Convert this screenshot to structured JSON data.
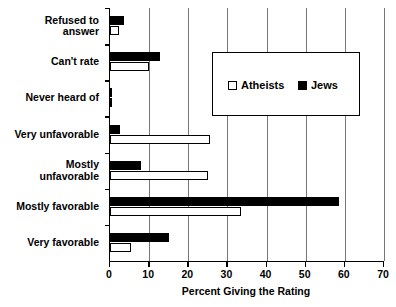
{
  "chart_data": {
    "type": "bar",
    "orientation": "horizontal",
    "title": "",
    "xlabel": "Percent Giving the Rating",
    "ylabel": "",
    "xlim": [
      0,
      70
    ],
    "xticks": [
      0,
      10,
      20,
      30,
      40,
      50,
      60,
      70
    ],
    "grid": true,
    "legend_position": "upper-right-inside",
    "categories": [
      "Refused to\nanswer",
      "Can't rate",
      "Never heard of",
      "Very unfavorable",
      "Mostly\nunfavorable",
      "Mostly favorable",
      "Very favorable"
    ],
    "series": [
      {
        "name": "Atheists",
        "style": "hollow",
        "values": [
          2.3,
          10.0,
          0.4,
          25.5,
          25.0,
          33.5,
          5.4
        ]
      },
      {
        "name": "Jews",
        "style": "filled",
        "values": [
          3.5,
          12.8,
          0.4,
          2.5,
          7.9,
          58.5,
          15.0
        ]
      }
    ]
  },
  "legend": {
    "items": [
      {
        "label": "Atheists"
      },
      {
        "label": "Jews"
      }
    ]
  },
  "axis": {
    "x_title": "Percent Giving the Rating",
    "tick_labels": [
      "0",
      "10",
      "20",
      "30",
      "40",
      "50",
      "60",
      "70"
    ]
  },
  "categories_display": [
    "Refused to\nanswer",
    "Can't rate",
    "Never heard of",
    "Very unfavorable",
    "Mostly\nunfavorable",
    "Mostly favorable",
    "Very favorable"
  ]
}
